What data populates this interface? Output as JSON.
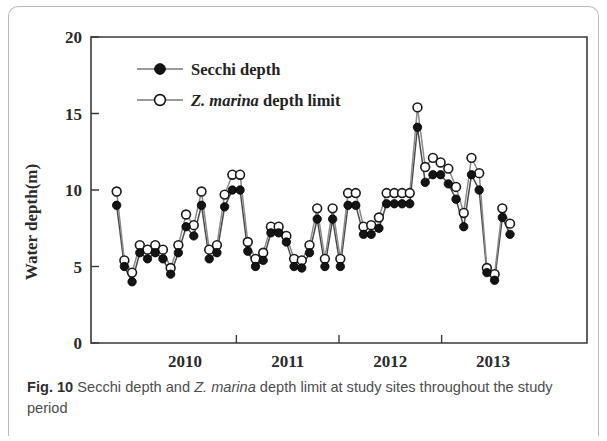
{
  "figure": {
    "caption_label": "Fig. 10",
    "caption_text_before_italic": " Secchi depth and ",
    "caption_italic": "Z. marina",
    "caption_text_after_italic": " depth limit at study sites throughout the study period"
  },
  "chart_data": {
    "type": "line",
    "title": "",
    "xlabel": "",
    "ylabel": "Water depth(m)",
    "ylim": [
      0,
      20
    ],
    "yticks": [
      0,
      5,
      10,
      15,
      20
    ],
    "ytick_labels": [
      "0",
      "5",
      "10",
      "15",
      "20"
    ],
    "xtick_labels": [
      "2010",
      "2011",
      "2012",
      "2013"
    ],
    "xtick_positions": [
      11,
      23,
      35,
      47
    ],
    "xlim": [
      0,
      58
    ],
    "grid": false,
    "legend_position": "top-left",
    "markers": {
      "secchi": "filled-circle",
      "zmarina": "open-circle"
    },
    "series": [
      {
        "name": "Secchi depth",
        "marker": "filled-circle",
        "values": [
          9.0,
          5.0,
          4.0,
          5.9,
          5.5,
          5.9,
          5.5,
          4.5,
          5.9,
          7.6,
          7.0,
          9.0,
          5.5,
          5.9,
          8.9,
          10.0,
          10.0,
          6.0,
          5.0,
          5.4,
          7.2,
          7.2,
          6.6,
          5.0,
          4.9,
          5.9,
          8.1,
          5.0,
          8.1,
          5.0,
          9.0,
          9.0,
          7.1,
          7.1,
          7.5,
          9.1,
          9.1,
          9.1,
          9.1,
          14.1,
          10.5,
          11.0,
          11.0,
          10.4,
          9.4,
          7.6,
          11.0,
          10.0,
          4.6,
          4.1,
          8.2,
          7.1
        ]
      },
      {
        "name": "Z. marina depth limit",
        "marker": "open-circle",
        "values": [
          9.9,
          5.4,
          4.6,
          6.4,
          6.1,
          6.4,
          6.1,
          4.9,
          6.4,
          8.4,
          7.7,
          9.9,
          6.1,
          6.4,
          9.7,
          11.0,
          11.0,
          6.6,
          5.5,
          5.9,
          7.6,
          7.6,
          7.0,
          5.5,
          5.4,
          6.4,
          8.8,
          5.5,
          8.8,
          5.5,
          9.8,
          9.8,
          7.6,
          7.7,
          8.2,
          9.8,
          9.8,
          9.8,
          9.8,
          15.4,
          11.5,
          12.1,
          11.8,
          11.4,
          10.2,
          8.5,
          12.1,
          11.1,
          4.9,
          4.5,
          8.8,
          7.8
        ]
      }
    ],
    "legend": [
      {
        "label_plain": "Secchi depth",
        "label_italic": "",
        "label_tail": "",
        "marker": "filled-circle"
      },
      {
        "label_plain": "",
        "label_italic": "Z. marina",
        "label_tail": " depth limit",
        "marker": "open-circle"
      }
    ],
    "colors": {
      "filled_marker": "#141414",
      "open_marker_fill": "#ffffff",
      "open_marker_stroke": "#1a1a1a",
      "line": "#8a8a8a",
      "axis": "#3a3a3a"
    }
  }
}
